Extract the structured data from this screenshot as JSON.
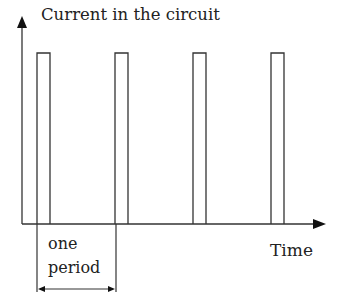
{
  "diagram": {
    "y_axis_label": "Current in the circuit",
    "x_axis_label": "Time",
    "period_label_line1": "one",
    "period_label_line2": "period",
    "colors": {
      "stroke": "#333333",
      "background": "#ffffff"
    },
    "pulses": [
      {
        "x_left": 37,
        "x_right": 50
      },
      {
        "x_left": 115,
        "x_right": 128
      },
      {
        "x_left": 193,
        "x_right": 206
      },
      {
        "x_left": 271,
        "x_right": 284
      }
    ],
    "pulse_top_y": 53,
    "baseline_y": 224,
    "period_span": {
      "from_x": 37,
      "to_x": 116
    }
  }
}
